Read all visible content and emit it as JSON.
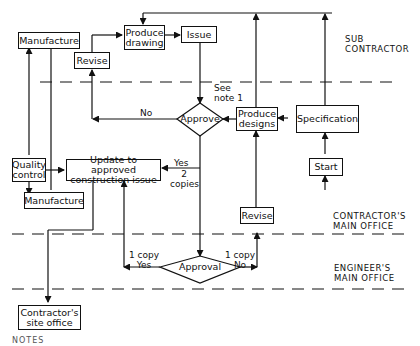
{
  "zones": [
    {
      "id": "sub",
      "lines": [
        "SUB",
        "CONTRACTOR"
      ]
    },
    {
      "id": "contractor",
      "lines": [
        "CONTRACTOR'S",
        "MAIN OFFICE"
      ]
    },
    {
      "id": "engineer",
      "lines": [
        "ENGINEER'S",
        "MAIN OFFICE"
      ]
    }
  ],
  "boxes": {
    "manufacture_top": "Manufacture",
    "revise_top": "Revise",
    "produce_drawing": [
      "Produce",
      "drawing"
    ],
    "issue": "Issue",
    "produce_designs": [
      "Produce",
      "designs"
    ],
    "specification": "Specification",
    "start": "Start",
    "quality_control": [
      "Quality",
      "control"
    ],
    "update": [
      "Update to approved",
      "construction issue"
    ],
    "manufacture_bottom": "Manufacture",
    "revise_bottom": "Revise",
    "site_office": [
      "Contractor's",
      "site office"
    ]
  },
  "decisions": {
    "approve": "Approve",
    "approval": "Approval"
  },
  "labels": {
    "see_note": [
      "See",
      "note 1"
    ],
    "no_top": "No",
    "yes_mid": "Yes",
    "two_copies": [
      "2",
      "copies"
    ],
    "one_copy_yes": [
      "1 copy",
      "Yes"
    ],
    "one_copy_no": [
      "1 copy",
      "No"
    ],
    "notes": "NOTES"
  }
}
